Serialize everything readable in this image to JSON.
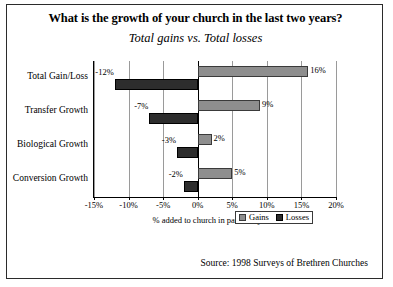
{
  "title": "What is the growth of your church in the last two years?",
  "subtitle": "Total gains vs. Total losses",
  "source": "Source: 1998 Surveys of Brethren Churches",
  "legend": {
    "gains": "Gains",
    "losses": "Losses"
  },
  "chart_data": {
    "type": "bar",
    "orientation": "horizontal",
    "title": "What is the growth of your church in the last two years?",
    "subtitle": "Total gains vs. Total losses",
    "categories": [
      "Total Gain/Loss",
      "Transfer Growth",
      "Biological Growth",
      "Conversion Growth"
    ],
    "series": [
      {
        "name": "Gains",
        "values": [
          16,
          9,
          2,
          5
        ],
        "labels": [
          "16%",
          "9%",
          "2%",
          "5%"
        ]
      },
      {
        "name": "Losses",
        "values": [
          -12,
          -7,
          -3,
          -2
        ],
        "labels": [
          "-12%",
          "-7%",
          "-3%",
          "-2%"
        ]
      }
    ],
    "xlabel": "% added to church in past two years",
    "ylabel": "",
    "xlim": [
      -15,
      20
    ],
    "xticks": [
      -15,
      -10,
      -5,
      0,
      5,
      10,
      15,
      20
    ],
    "xticklabels": [
      "-15%",
      "-10%",
      "-5%",
      "0%",
      "5%",
      "10%",
      "15%",
      "20%"
    ],
    "grid": true,
    "legend_position": "bottom-right",
    "annotation": "Source: 1998 Surveys of Brethren Churches"
  }
}
